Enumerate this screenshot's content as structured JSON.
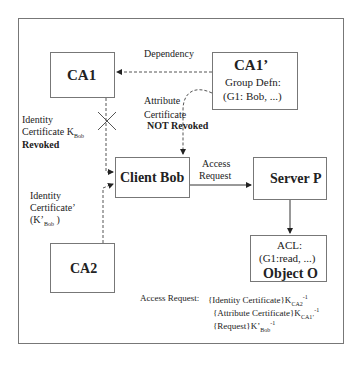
{
  "nodes": {
    "ca1": {
      "title": "CA1"
    },
    "ca1p": {
      "title": "CA1’",
      "line1": "Group Defn:",
      "line2": "(G1: Bob, ...)"
    },
    "client": {
      "title": "Client Bob"
    },
    "server": {
      "title": "Server P"
    },
    "object": {
      "line1": "ACL:",
      "line2": "(G1:read, ...)",
      "title": "Object O"
    },
    "ca2": {
      "title": "CA2"
    }
  },
  "labels": {
    "dependency": "Dependency",
    "attr_cert_1": "Attribute",
    "attr_cert_2": "Certificate",
    "attr_cert_3": "NOT Revoked",
    "id_cert_1": "Identity",
    "id_cert_2": "Certificate K",
    "id_cert_sub": "Bob",
    "id_cert_3": "Revoked",
    "id_cert2_1": "Identity",
    "id_cert2_2": "Certificate’",
    "id_cert2_3": "(K’",
    "id_cert2_sub": "Bob",
    "id_cert2_4": ")",
    "access_1": "Access",
    "access_2": "Request"
  },
  "formula": {
    "prefix": "Access Request:",
    "line1": "{Identity Certificate}K",
    "line1_sub": "CA2",
    "line2": "{Attribute Certificate}K",
    "line2_sub": "CA1’",
    "line3": "{Request}K’",
    "line3_sub": "Bob",
    "sup": "-1"
  }
}
